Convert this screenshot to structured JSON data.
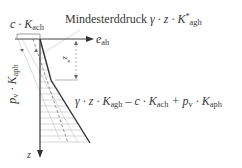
{
  "diagram": {
    "title": "Mindesterddruck",
    "labels": {
      "mindest_text": "Mindesterddruck",
      "mindest_formula_prefix": "γ · z · K",
      "mindest_formula_sup": "*",
      "mindest_formula_sub": "agh",
      "cohesion_prefix": "c · K",
      "cohesion_sub": "ach",
      "e_axis_main": "e",
      "e_axis_sub": "ah",
      "z_axis": "z",
      "z_star_main": "z",
      "z_star_sup": "*",
      "pv_main": "p",
      "pv_sub": "v",
      "pv_mid": " · K",
      "pv_sub2": "aph",
      "formula_part1": "γ · z · K",
      "formula_sub1": "agh",
      "formula_part2": " – c · K",
      "formula_sub2": "ach",
      "formula_part3": " + p",
      "formula_sub3": "v",
      "formula_part4": " · K",
      "formula_sub4": "aph"
    },
    "colors": {
      "axis": "#333333",
      "pressure_line": "#333333",
      "dashed_line": "#888888",
      "light_lines": "#cccccc",
      "hatch": "#bbbbbb"
    }
  }
}
